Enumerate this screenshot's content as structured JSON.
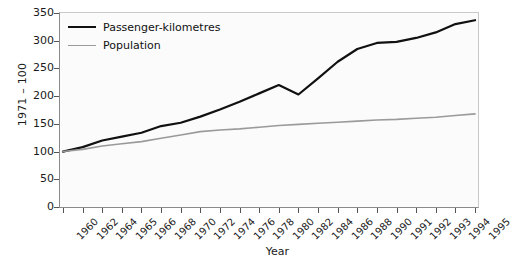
{
  "chart_data": {
    "type": "line",
    "title": "",
    "xlabel": "Year",
    "ylabel": "1971 – 100",
    "ylim": [
      0,
      350
    ],
    "yticks": [
      0,
      50,
      100,
      150,
      200,
      250,
      300,
      350
    ],
    "grid": false,
    "legend_position": "top-left",
    "categories": [
      "1960",
      "1962",
      "1964",
      "1965",
      "1966",
      "1968",
      "1970",
      "1972",
      "1974",
      "1976",
      "1978",
      "1980",
      "1982",
      "1984",
      "1986",
      "1988",
      "1990",
      "1991",
      "1992",
      "1993",
      "1994",
      "1995"
    ],
    "series": [
      {
        "name": "Passenger-kilometres",
        "color": "#111111",
        "width": 2.2,
        "values": [
          100,
          108,
          120,
          127,
          134,
          146,
          152,
          163,
          176,
          190,
          205,
          220,
          203,
          232,
          262,
          285,
          296,
          298,
          305,
          315,
          330,
          337
        ]
      },
      {
        "name": "Population",
        "color": "#9a9a9a",
        "width": 1.6,
        "values": [
          100,
          104,
          110,
          114,
          118,
          124,
          130,
          136,
          139,
          141,
          144,
          147,
          149,
          151,
          153,
          155,
          157,
          158,
          160,
          162,
          165,
          168
        ]
      }
    ]
  },
  "legend": {
    "items": [
      {
        "label": "Passenger-kilometres"
      },
      {
        "label": "Population"
      }
    ]
  },
  "axes": {
    "x_title": "Year",
    "y_title": "1971 – 100"
  },
  "colors": {
    "series_passenger": "#111111",
    "series_population": "#9a9a9a",
    "plot_background": "#fbfbfb",
    "axis": "#555555"
  }
}
